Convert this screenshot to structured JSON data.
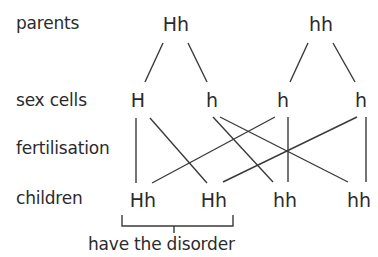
{
  "row_labels": {
    "parents": "parents",
    "sex_cells": "sex cells",
    "fertilisation": "fertilisation",
    "children": "children"
  },
  "parents": [
    {
      "genotype": "Hh"
    },
    {
      "genotype": "hh"
    }
  ],
  "sex_cells": [
    {
      "allele": "H"
    },
    {
      "allele": "h"
    },
    {
      "allele": "h"
    },
    {
      "allele": "h"
    }
  ],
  "children": [
    {
      "genotype": "Hh"
    },
    {
      "genotype": "Hh"
    },
    {
      "genotype": "hh"
    },
    {
      "genotype": "hh"
    }
  ],
  "annotation": {
    "bracket_label": "have the disorder",
    "bracket_covers": [
      0,
      1
    ]
  },
  "connections": {
    "parent_to_sex_cell": [
      [
        0,
        0
      ],
      [
        0,
        1
      ],
      [
        1,
        2
      ],
      [
        1,
        3
      ]
    ],
    "sex_cell_to_child": [
      [
        0,
        0
      ],
      [
        0,
        1
      ],
      [
        1,
        2
      ],
      [
        1,
        3
      ],
      [
        2,
        0
      ],
      [
        2,
        2
      ],
      [
        3,
        1
      ],
      [
        3,
        3
      ]
    ]
  },
  "colors": {
    "text": "#2b2b2b",
    "lines": "#3a3a3a",
    "background": "#ffffff"
  }
}
